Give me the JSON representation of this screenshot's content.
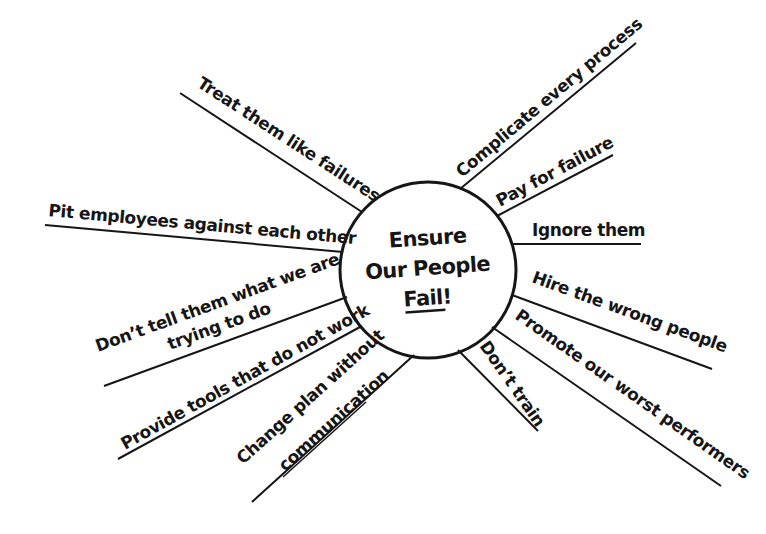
{
  "center": {
    "line1": "Ensure",
    "line2": "Our People",
    "line3": "Fail",
    "line3_suffix": "!",
    "underlined_word": "Fail"
  },
  "colors": {
    "ink": "#161616",
    "background": "#ffffff"
  },
  "spokes": [
    {
      "id": "treat-them-like-failures",
      "label": "Treat them like failures",
      "side": "upper-left"
    },
    {
      "id": "complicate-every-process",
      "label": "Complicate every process",
      "side": "upper-right"
    },
    {
      "id": "pay-for-failure",
      "label": "Pay for failure",
      "side": "right"
    },
    {
      "id": "ignore-them",
      "label": "Ignore them",
      "side": "right"
    },
    {
      "id": "pit-employees-against-each-other",
      "label": "Pit employees against each other",
      "side": "left"
    },
    {
      "id": "dont-tell-them",
      "label": "Don’t tell them what we are",
      "label_line2": "trying to do",
      "side": "left"
    },
    {
      "id": "provide-tools-that-do-not-work",
      "label": "Provide tools that do not work",
      "side": "lower-left"
    },
    {
      "id": "change-plan-without-communication",
      "label": "Change plan without",
      "label_line2": "communication",
      "side": "lower-left"
    },
    {
      "id": "dont-train",
      "label": "Don’t train",
      "side": "lower-right"
    },
    {
      "id": "hire-the-wrong-people",
      "label": "Hire the wrong people",
      "side": "right"
    },
    {
      "id": "promote-our-worst-performers",
      "label": "Promote our worst performers",
      "side": "lower-right"
    }
  ]
}
